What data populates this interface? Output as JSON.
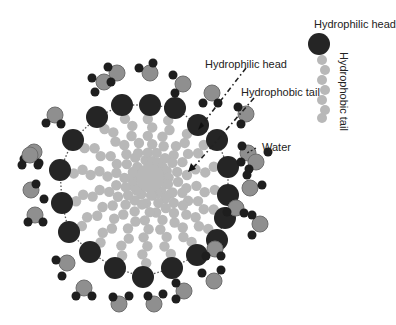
{
  "diagram": {
    "type": "micelle-structure",
    "labels": {
      "legend_head": "Hydrophilic head",
      "legend_tail": "Hydrophobic tail",
      "pointer_head": "Hydrophilic head",
      "pointer_tail": "Hydrophobic tail",
      "pointer_water": "Water"
    },
    "colors": {
      "head": "#252525",
      "tail": "#b8b8b8",
      "oxygen": "#8f8f8f",
      "oxygen_stroke": "#6e6e6e",
      "hydrogen": "#1e1e1e",
      "boundary": "#555555",
      "background": "#ffffff"
    },
    "center": [
      150,
      178
    ],
    "heads": [
      [
        97,
        117
      ],
      [
        122,
        105
      ],
      [
        150,
        105
      ],
      [
        175,
        108
      ],
      [
        198,
        125
      ],
      [
        217,
        140
      ],
      [
        228,
        167
      ],
      [
        228,
        195
      ],
      [
        225,
        218
      ],
      [
        217,
        240
      ],
      [
        197,
        255
      ],
      [
        172,
        268
      ],
      [
        143,
        277
      ],
      [
        115,
        268
      ],
      [
        90,
        252
      ],
      [
        69,
        232
      ],
      [
        62,
        203
      ],
      [
        60,
        170
      ],
      [
        73,
        140
      ]
    ],
    "water": [
      {
        "o": [
          104,
          82
        ],
        "h": [
          [
            92,
            78
          ],
          [
            95,
            92
          ]
        ]
      },
      {
        "o": [
          117,
          73
        ],
        "h": [
          [
            108,
            67
          ],
          [
            111,
            82
          ]
        ]
      },
      {
        "o": [
          150,
          73
        ],
        "h": [
          [
            139,
            68
          ],
          [
            153,
            63
          ]
        ]
      },
      {
        "o": [
          183,
          84
        ],
        "h": [
          [
            173,
            75
          ],
          [
            175,
            93
          ]
        ]
      },
      {
        "o": [
          212,
          93
        ],
        "h": [
          [
            203,
            103
          ],
          [
            218,
            103
          ]
        ]
      },
      {
        "o": [
          246,
          114
        ],
        "h": [
          [
            238,
            107
          ],
          [
            241,
            124
          ]
        ]
      },
      {
        "o": [
          248,
          153
        ],
        "h": [
          [
            242,
            146
          ],
          [
            241,
            162
          ]
        ]
      },
      {
        "o": [
          256,
          162
        ],
        "h": [
          [
            249,
            169
          ],
          [
            268,
            152
          ]
        ]
      },
      {
        "o": [
          250,
          188
        ],
        "h": [
          [
            247,
            175
          ],
          [
            262,
            185
          ]
        ]
      },
      {
        "o": [
          260,
          224
        ],
        "h": [
          [
            252,
            215
          ],
          [
            252,
            235
          ]
        ]
      },
      {
        "o": [
          236,
          208
        ],
        "h": [
          [
            227,
            212
          ],
          [
            244,
            213
          ]
        ]
      },
      {
        "o": [
          215,
          249
        ],
        "h": [
          [
            206,
            256
          ],
          [
            221,
            256
          ]
        ]
      },
      {
        "o": [
          214,
          281
        ],
        "h": [
          [
            202,
            273
          ],
          [
            221,
            270
          ]
        ]
      },
      {
        "o": [
          184,
          291
        ],
        "h": [
          [
            176,
            283
          ],
          [
            176,
            299
          ]
        ]
      },
      {
        "o": [
          154,
          304
        ],
        "h": [
          [
            148,
            296
          ],
          [
            163,
            294
          ]
        ]
      },
      {
        "o": [
          119,
          304
        ],
        "h": [
          [
            113,
            297
          ],
          [
            129,
            296
          ]
        ]
      },
      {
        "o": [
          84,
          288
        ],
        "h": [
          [
            76,
            296
          ],
          [
            92,
            296
          ]
        ]
      },
      {
        "o": [
          67,
          263
        ],
        "h": [
          [
            56,
            260
          ],
          [
            62,
            276
          ]
        ]
      },
      {
        "o": [
          35,
          215
        ],
        "h": [
          [
            28,
            222
          ],
          [
            43,
            222
          ]
        ]
      },
      {
        "o": [
          31,
          190
        ],
        "h": [
          [
            36,
            184
          ],
          [
            44,
            199
          ]
        ]
      },
      {
        "o": [
          55,
          115
        ],
        "h": [
          [
            46,
            123
          ],
          [
            61,
            124
          ]
        ]
      },
      {
        "o": [
          34,
          152
        ],
        "h": [
          [
            24,
            159
          ],
          [
            39,
            163
          ]
        ]
      },
      {
        "o": [
          30,
          155
        ],
        "h": [
          [
            22,
            165
          ],
          [
            38,
            165
          ]
        ]
      }
    ],
    "legend_molecule": {
      "head": [
        319,
        44
      ],
      "tail_points": [
        [
          322,
          60
        ],
        [
          325,
          70
        ],
        [
          322,
          80
        ],
        [
          325,
          90
        ],
        [
          322,
          100
        ],
        [
          325,
          110
        ],
        [
          322,
          118
        ]
      ]
    }
  }
}
